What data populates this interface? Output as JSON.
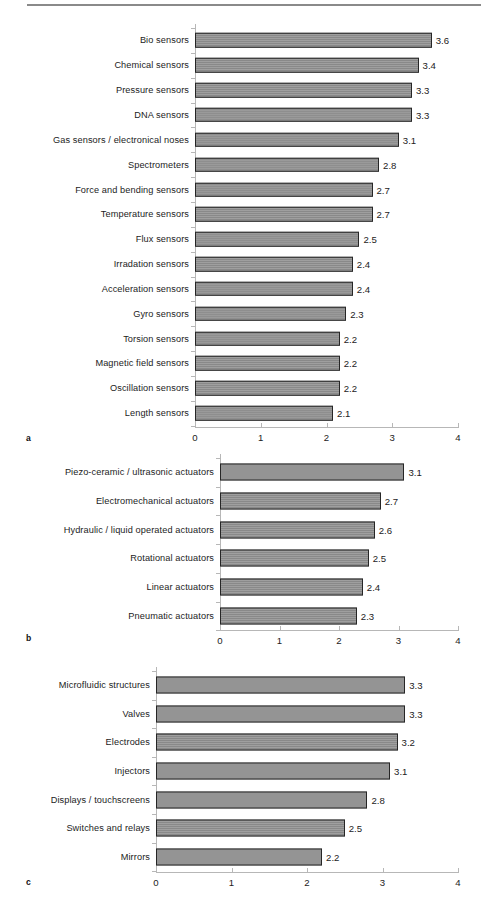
{
  "page": {
    "rule": "horizontal-rule"
  },
  "chart_data": [
    {
      "type": "bar",
      "orientation": "horizontal",
      "panel": "a",
      "title": "",
      "xlabel": "",
      "ylabel": "",
      "xlim": [
        0,
        4
      ],
      "xticks": [
        "0",
        "1",
        "2",
        "3",
        "4"
      ],
      "grid": false,
      "categories": [
        "Bio sensors",
        "Chemical sensors",
        "Pressure sensors",
        "DNA sensors",
        "Gas sensors / electronical noses",
        "Spectrometers",
        "Force and bending sensors",
        "Temperature sensors",
        "Flux sensors",
        "Irradation sensors",
        "Acceleration sensors",
        "Gyro sensors",
        "Torsion sensors",
        "Magnetic field sensors",
        "Oscillation sensors",
        "Length sensors"
      ],
      "values": [
        3.6,
        3.4,
        3.3,
        3.3,
        3.1,
        2.8,
        2.7,
        2.7,
        2.5,
        2.4,
        2.4,
        2.3,
        2.2,
        2.2,
        2.2,
        2.1
      ],
      "value_labels": [
        "3.6",
        "3.4",
        "3.3",
        "3.3",
        "3.1",
        "2.8",
        "2.7",
        "2.7",
        "2.5",
        "2.4",
        "2.4",
        "2.3",
        "2.2",
        "2.2",
        "2.2",
        "2.1"
      ]
    },
    {
      "type": "bar",
      "orientation": "horizontal",
      "panel": "b",
      "title": "",
      "xlabel": "",
      "ylabel": "",
      "xlim": [
        0,
        4
      ],
      "xticks": [
        "0",
        "1",
        "2",
        "3",
        "4"
      ],
      "grid": false,
      "categories": [
        "Piezo-ceramic / ultrasonic actuators",
        "Electromechanical actuators",
        "Hydraulic / liquid operated actuators",
        "Rotational actuators",
        "Linear actuators",
        "Pneumatic actuators"
      ],
      "values": [
        3.1,
        2.7,
        2.6,
        2.5,
        2.4,
        2.3
      ],
      "value_labels": [
        "3.1",
        "2.7",
        "2.6",
        "2.5",
        "2.4",
        "2.3"
      ]
    },
    {
      "type": "bar",
      "orientation": "horizontal",
      "panel": "c",
      "title": "",
      "xlabel": "",
      "ylabel": "",
      "xlim": [
        0,
        4
      ],
      "xticks": [
        "0",
        "1",
        "2",
        "3",
        "4"
      ],
      "grid": false,
      "categories": [
        "Microfluidic structures",
        "Valves",
        "Electrodes",
        "Injectors",
        "Displays / touchscreens",
        "Switches and relays",
        "Mirrors"
      ],
      "values": [
        3.3,
        3.3,
        3.2,
        3.1,
        2.8,
        2.5,
        2.2
      ],
      "value_labels": [
        "3.3",
        "3.3",
        "3.2",
        "3.1",
        "2.8",
        "2.5",
        "2.2"
      ]
    }
  ],
  "panels": {
    "a": {
      "letter": "a"
    },
    "b": {
      "letter": "b"
    },
    "c": {
      "letter": "c"
    }
  },
  "colors": {
    "bar_fill": "#8d8d8d",
    "bar_stroke": "#262626",
    "axis": "#b7b7b7",
    "text": "#1c1c1c",
    "rule": "#8a8a8a"
  }
}
